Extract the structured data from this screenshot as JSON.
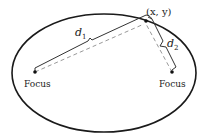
{
  "diagram": {
    "point_label": "(x, y)",
    "distance_1": {
      "symbol": "d",
      "subscript": "1"
    },
    "distance_2": {
      "symbol": "d",
      "subscript": "2"
    },
    "focus_left_label": "Focus",
    "focus_right_label": "Focus",
    "colors": {
      "ellipse": "#1a1a1a",
      "solid_line": "#333333",
      "dashed_line": "#999999",
      "text": "#222222"
    }
  }
}
